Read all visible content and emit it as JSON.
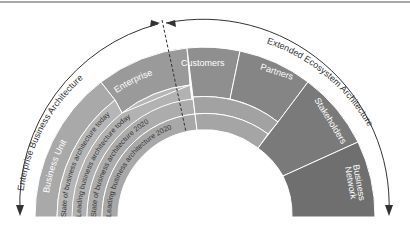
{
  "diagram": {
    "left_arc_label": "Enterprise Business Architecture",
    "right_arc_label": "Extended Ecosystem Architecture",
    "segments": {
      "business_unit": "Business Unit",
      "enterprise": "Enterprise",
      "customers": "Customers",
      "partners": "Partners",
      "stakeholders": "Stakeholders",
      "business_network_line1": "Business",
      "business_network_line2": "Network"
    },
    "bands": [
      "State of business architecture today",
      "Leading business architecture today",
      "State of business architecture 2020",
      "Leading business architecture 2020"
    ],
    "colors": {
      "business_unit": "#a9a9a9",
      "enterprise": "#9a9a9a",
      "customers": "#8f8f8f",
      "partners": "#858585",
      "stakeholders": "#7a7a7a",
      "business_network": "#6f6f6f",
      "band_today": "#b6b6b6",
      "band_2020": "#acacac",
      "right_inner": "#a2a2a2"
    }
  }
}
